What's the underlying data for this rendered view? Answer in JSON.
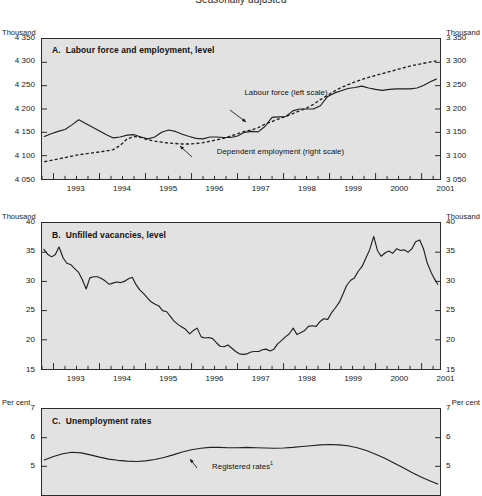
{
  "figure": {
    "title": "Seasonally adjusted"
  },
  "chart_data": [
    {
      "type": "line",
      "id": "panel-a",
      "title": "A.  Labour force and employment, level",
      "panel_letter": "A.",
      "panel_title": "Labour force and employment, level",
      "unit_left": "Thousand",
      "unit_right": "Thousand",
      "xlabel": "",
      "ylabel": "Thousand",
      "grid": false,
      "legend_position": "inline-annotations",
      "xlim": [
        1992.75,
        2001.4
      ],
      "ylim_left": [
        4050,
        4350
      ],
      "ylim_right": [
        3050,
        3350
      ],
      "yticks_left": [
        "4 350",
        "4 300",
        "4 250",
        "4 200",
        "4 150",
        "4 100",
        "4 050"
      ],
      "yticks_right": [
        "3 350",
        "3 300",
        "3 250",
        "3 200",
        "3 150",
        "3 100",
        "3 050"
      ],
      "ytick_values_left": [
        4350,
        4300,
        4250,
        4200,
        4150,
        4100,
        4050
      ],
      "ytick_values_right": [
        3350,
        3300,
        3250,
        3200,
        3150,
        3100,
        3050
      ],
      "xticks": [
        "1993",
        "1994",
        "1995",
        "1996",
        "1997",
        "1998",
        "1999",
        "2000",
        "2001"
      ],
      "xtick_values": [
        1993,
        1994,
        1995,
        1996,
        1997,
        1998,
        1999,
        2000,
        2001
      ],
      "annotations": [
        {
          "text": "Labour force (left scale)",
          "x": 1997.15,
          "y": 4232
        },
        {
          "text": "Dependent employment (right scale)",
          "x": 1996.55,
          "y": 4106
        }
      ],
      "series": [
        {
          "name": "Labour force (left scale)",
          "scale": "left",
          "style": "solid",
          "x": [
            1992.8,
            1992.95,
            1993.1,
            1993.25,
            1993.4,
            1993.55,
            1993.7,
            1993.85,
            1994.0,
            1994.15,
            1994.3,
            1994.45,
            1994.6,
            1994.75,
            1994.9,
            1995.05,
            1995.2,
            1995.35,
            1995.5,
            1995.65,
            1995.8,
            1995.95,
            1996.1,
            1996.25,
            1996.4,
            1996.55,
            1996.7,
            1996.85,
            1997.0,
            1997.15,
            1997.3,
            1997.45,
            1997.6,
            1997.75,
            1997.9,
            1998.05,
            1998.2,
            1998.35,
            1998.5,
            1998.65,
            1998.8,
            1998.95,
            1999.1,
            1999.25,
            1999.4,
            1999.55,
            1999.7,
            1999.85,
            2000.0,
            2000.15,
            2000.3,
            2000.45,
            2000.6,
            2000.75,
            2000.9,
            2001.05,
            2001.2,
            2001.32
          ],
          "values": [
            4141,
            4147,
            4152,
            4156,
            4166,
            4177,
            4169,
            4161,
            4153,
            4145,
            4138,
            4140,
            4144,
            4145,
            4140,
            4136,
            4140,
            4150,
            4155,
            4152,
            4146,
            4141,
            4137,
            4136,
            4140,
            4140,
            4139,
            4139,
            4142,
            4150,
            4152,
            4151,
            4163,
            4182,
            4183,
            4184,
            4196,
            4200,
            4200,
            4200,
            4207,
            4226,
            4234,
            4239,
            4244,
            4246,
            4249,
            4245,
            4242,
            4240,
            4242,
            4243,
            4243,
            4243,
            4245,
            4251,
            4259,
            4264
          ]
        },
        {
          "name": "Dependent employment (right scale)",
          "scale": "right",
          "style": "dashed",
          "x": [
            1992.8,
            1992.95,
            1993.1,
            1993.25,
            1993.4,
            1993.55,
            1993.7,
            1993.85,
            1994.0,
            1994.15,
            1994.3,
            1994.45,
            1994.6,
            1994.75,
            1994.9,
            1995.05,
            1995.2,
            1995.35,
            1995.5,
            1995.65,
            1995.8,
            1995.95,
            1996.1,
            1996.25,
            1996.4,
            1996.55,
            1996.7,
            1996.85,
            1997.0,
            1997.15,
            1997.3,
            1997.45,
            1997.6,
            1997.75,
            1997.9,
            1998.05,
            1998.2,
            1998.35,
            1998.5,
            1998.65,
            1998.8,
            1998.95,
            1999.1,
            1999.25,
            1999.4,
            1999.55,
            1999.7,
            1999.85,
            2000.0,
            2000.15,
            2000.3,
            2000.45,
            2000.6,
            2000.75,
            2000.9,
            2001.05,
            2001.2,
            2001.32
          ],
          "values": [
            3087,
            3090,
            3093,
            3096,
            3099,
            3102,
            3104,
            3106,
            3108,
            3110,
            3113,
            3122,
            3136,
            3141,
            3139,
            3134,
            3131,
            3129,
            3127,
            3126,
            3125,
            3125,
            3126,
            3128,
            3131,
            3134,
            3137,
            3142,
            3147,
            3152,
            3155,
            3160,
            3168,
            3173,
            3179,
            3184,
            3190,
            3196,
            3202,
            3210,
            3220,
            3229,
            3238,
            3246,
            3252,
            3258,
            3263,
            3268,
            3272,
            3276,
            3280,
            3284,
            3288,
            3292,
            3295,
            3298,
            3301,
            3303
          ]
        }
      ]
    },
    {
      "type": "line",
      "id": "panel-b",
      "title": "B.  Unfilled vacancies, level",
      "panel_letter": "B.",
      "panel_title": "Unfilled vacancies, level",
      "unit_left": "Thousand",
      "unit_right": "Thousand",
      "xlabel": "",
      "ylabel": "Thousand",
      "grid": false,
      "xlim": [
        1992.75,
        2001.4
      ],
      "ylim": [
        15,
        40
      ],
      "yticks": [
        "40",
        "35",
        "30",
        "25",
        "20",
        "15"
      ],
      "ytick_values": [
        40,
        35,
        30,
        25,
        20,
        15
      ],
      "xticks": [
        "1993",
        "1994",
        "1995",
        "1996",
        "1997",
        "1998",
        "1999",
        "2000",
        "2001"
      ],
      "xtick_values": [
        1993,
        1994,
        1995,
        1996,
        1997,
        1998,
        1999,
        2000,
        2001
      ],
      "series": [
        {
          "name": "Unfilled vacancies",
          "style": "solid",
          "x": [
            1992.79,
            1992.88,
            1992.96,
            1993.04,
            1993.12,
            1993.21,
            1993.29,
            1993.37,
            1993.46,
            1993.54,
            1993.62,
            1993.71,
            1993.79,
            1993.87,
            1993.96,
            1994.04,
            1994.12,
            1994.21,
            1994.29,
            1994.37,
            1994.46,
            1994.54,
            1994.62,
            1994.71,
            1994.79,
            1994.87,
            1994.96,
            1995.04,
            1995.12,
            1995.21,
            1995.29,
            1995.37,
            1995.46,
            1995.54,
            1995.62,
            1995.71,
            1995.79,
            1995.87,
            1995.96,
            1996.04,
            1996.12,
            1996.21,
            1996.29,
            1996.37,
            1996.46,
            1996.54,
            1996.62,
            1996.71,
            1996.79,
            1996.87,
            1996.96,
            1997.04,
            1997.12,
            1997.21,
            1997.29,
            1997.37,
            1997.46,
            1997.54,
            1997.62,
            1997.71,
            1997.79,
            1997.87,
            1997.96,
            1998.04,
            1998.12,
            1998.21,
            1998.29,
            1998.37,
            1998.46,
            1998.54,
            1998.62,
            1998.71,
            1998.79,
            1998.87,
            1998.96,
            1999.04,
            1999.12,
            1999.21,
            1999.29,
            1999.37,
            1999.46,
            1999.54,
            1999.62,
            1999.71,
            1999.79,
            1999.87,
            1999.96,
            2000.04,
            2000.12,
            2000.21,
            2000.29,
            2000.37,
            2000.46,
            2000.54,
            2000.62,
            2000.71,
            2000.79,
            2000.87,
            2000.96,
            2001.04,
            2001.12,
            2001.21,
            2001.29,
            2001.35
          ],
          "values": [
            35.5,
            34.6,
            34.2,
            34.6,
            35.9,
            34.0,
            33.1,
            32.9,
            32.2,
            31.6,
            30.4,
            28.7,
            30.6,
            30.8,
            30.8,
            30.5,
            30.1,
            29.5,
            29.7,
            29.9,
            29.8,
            30.0,
            30.4,
            30.7,
            29.5,
            28.6,
            27.9,
            27.2,
            26.5,
            26.1,
            25.8,
            25.0,
            24.8,
            24.0,
            23.2,
            22.6,
            22.2,
            21.8,
            21.0,
            21.6,
            22.0,
            20.5,
            20.3,
            20.4,
            20.2,
            19.5,
            18.9,
            18.8,
            19.1,
            18.6,
            18.0,
            17.6,
            17.5,
            17.6,
            17.9,
            18.0,
            18.0,
            18.3,
            18.4,
            18.1,
            18.4,
            19.3,
            19.9,
            20.5,
            21.0,
            22.0,
            20.9,
            21.2,
            21.6,
            22.3,
            22.4,
            22.3,
            23.1,
            23.6,
            23.5,
            24.6,
            25.4,
            26.4,
            27.8,
            29.3,
            30.2,
            30.6,
            31.7,
            32.6,
            34.0,
            35.4,
            37.7,
            35.3,
            34.3,
            34.9,
            35.2,
            34.8,
            35.6,
            35.3,
            35.4,
            35.0,
            35.6,
            36.8,
            37.1,
            35.6,
            33.2,
            31.5,
            30.3,
            29.5,
            27.8
          ]
        }
      ]
    },
    {
      "type": "line",
      "id": "panel-c",
      "title": "C.  Unemployment rates",
      "panel_letter": "C.",
      "panel_title": "Unemployment rates",
      "unit_left": "Per cent",
      "unit_right": "Per cent",
      "xlabel": "",
      "ylabel": "Per cent",
      "grid": false,
      "xlim": [
        1992.75,
        2001.4
      ],
      "ylim": [
        4.0,
        7.0
      ],
      "yticks": [
        "7",
        "6",
        "5"
      ],
      "ytick_values": [
        7,
        6,
        5
      ],
      "xticks": [],
      "annotations": [
        {
          "text": "Registered rates",
          "footnote": "1",
          "x": 1996.45,
          "y": 5.02
        }
      ],
      "series": [
        {
          "name": "Registered rates",
          "style": "solid",
          "x": [
            1992.8,
            1993.0,
            1993.2,
            1993.4,
            1993.6,
            1993.8,
            1994.0,
            1994.2,
            1994.4,
            1994.6,
            1994.8,
            1995.0,
            1995.2,
            1995.4,
            1995.6,
            1995.8,
            1996.0,
            1996.2,
            1996.4,
            1996.6,
            1996.8,
            1997.0,
            1997.2,
            1997.4,
            1997.6,
            1997.8,
            1998.0,
            1998.2,
            1998.4,
            1998.6,
            1998.8,
            1999.0,
            1999.2,
            1999.4,
            1999.6,
            1999.8,
            2000.0,
            2000.2,
            2000.4,
            2000.6,
            2000.8,
            2001.0,
            2001.2,
            2001.35
          ],
          "values": [
            5.22,
            5.34,
            5.44,
            5.49,
            5.47,
            5.4,
            5.32,
            5.25,
            5.21,
            5.18,
            5.17,
            5.19,
            5.24,
            5.31,
            5.4,
            5.5,
            5.58,
            5.63,
            5.66,
            5.66,
            5.65,
            5.65,
            5.66,
            5.65,
            5.64,
            5.63,
            5.64,
            5.66,
            5.69,
            5.72,
            5.75,
            5.76,
            5.75,
            5.72,
            5.65,
            5.55,
            5.42,
            5.28,
            5.12,
            4.95,
            4.78,
            4.62,
            4.48,
            4.38
          ]
        }
      ]
    }
  ]
}
